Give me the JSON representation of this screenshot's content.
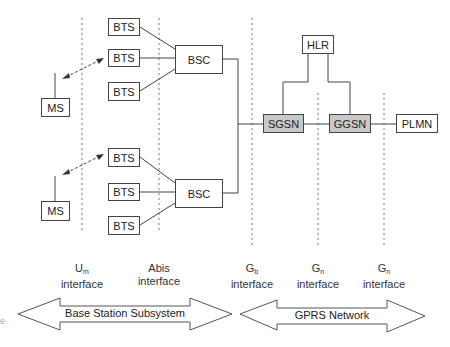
{
  "diagram": {
    "title": "",
    "nodes": {
      "bts_1": "BTS",
      "bts_2": "BTS",
      "bts_3": "BTS",
      "bts_4": "BTS",
      "bts_5": "BTS",
      "bts_6": "BTS",
      "bsc_1": "BSC",
      "bsc_2": "BSC",
      "ms_1": "MS",
      "ms_2": "MS",
      "hlr": "HLR",
      "sgsn": "SGSN",
      "ggsn": "GGSN",
      "plmn": "PLMN"
    },
    "interfaces": [
      {
        "main": "U",
        "sub": "m",
        "label": "interface"
      },
      {
        "main": "Abis",
        "sub": "",
        "label": "interface"
      },
      {
        "main": "G",
        "sub": "b",
        "label": "interface"
      },
      {
        "main": "G",
        "sub": "n",
        "label": "interface"
      },
      {
        "main": "G",
        "sub": "n",
        "label": "interface"
      }
    ],
    "regions": {
      "bss": "Base Station Subsystem",
      "gprs": "GPRS Network"
    },
    "edge_fragment": "e",
    "colors": {
      "gray_node": "#c8c8c8",
      "line": "#444444"
    }
  }
}
